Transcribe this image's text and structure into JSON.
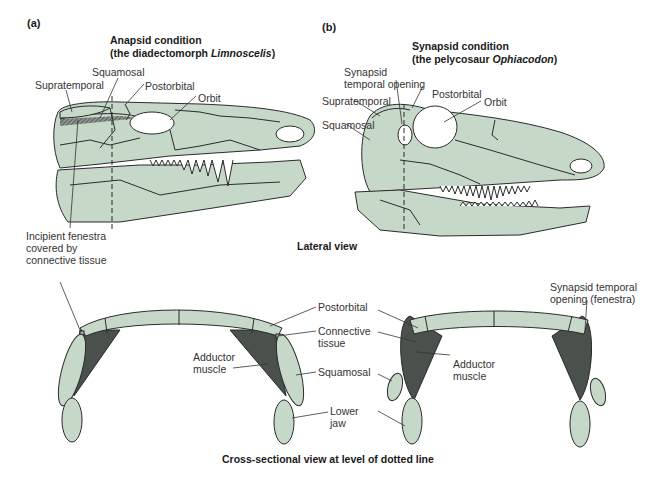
{
  "colors": {
    "bone_fill": "#c6d8c8",
    "outline": "#2b2b2b",
    "muscle": "#4a504c",
    "text": "#333333"
  },
  "panel_a": {
    "letter": "(a)",
    "title_line1": "Anapsid condition",
    "title_line2_prefix": "(the diadectomorph ",
    "title_line2_italic": "Limnoscelis",
    "title_line2_suffix": ")",
    "labels": {
      "squamosal": "Squamosal",
      "supratemporal": "Supratemporal",
      "postorbital": "Postorbital",
      "orbit": "Orbit",
      "incipient_line1": "Incipient fenestra",
      "incipient_line2": "covered by",
      "incipient_line3": "connective tissue"
    }
  },
  "panel_b": {
    "letter": "(b)",
    "title_line1": "Synapsid condition",
    "title_line2_prefix": "(the pelycosaur ",
    "title_line2_italic": "Ophiacodon",
    "title_line2_suffix": ")",
    "labels": {
      "synapsid_line1": "Synapsid",
      "synapsid_line2": "temporal opening",
      "supratemporal": "Supratemporal",
      "squamosal": "Squamosal",
      "postorbital": "Postorbital",
      "orbit": "Orbit"
    }
  },
  "lateral_view_caption": "Lateral view",
  "cross_section": {
    "labels": {
      "postorbital": "Postorbital",
      "connective_line1": "Connective",
      "connective_line2": "tissue",
      "adductor_a_line1": "Adductor",
      "adductor_a_line2": "muscle",
      "squamosal": "Squamosal",
      "lower_line1": "Lower",
      "lower_line2": "jaw",
      "adductor_b_line1": "Adductor",
      "adductor_b_line2": "muscle",
      "fenestra_line1": "Synapsid temporal",
      "fenestra_line2": "opening (fenestra)"
    },
    "caption": "Cross-sectional view at level of dotted line"
  }
}
